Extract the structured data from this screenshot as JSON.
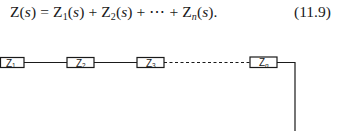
{
  "equation": {
    "lhs": "Z(s)",
    "terms": [
      "Z1(s)",
      "Z2(s)",
      "Zn(s)"
    ],
    "ellipsis": "⋯",
    "number": "(11.9)"
  },
  "diagram": {
    "type": "series-impedance-chain",
    "boxes": [
      {
        "label": "Z",
        "sub": "1"
      },
      {
        "label": "Z",
        "sub": "2"
      },
      {
        "label": "Z",
        "sub": "3"
      },
      {
        "label": "Z",
        "sub": "n"
      }
    ],
    "connection_style": {
      "solid": "Z1–Z2–Z3",
      "dashed": "Z3…Zn"
    },
    "stroke_color": "#1a1a1a"
  }
}
